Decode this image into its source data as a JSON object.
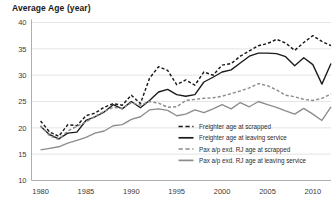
{
  "chart_data": {
    "type": "line",
    "title": "Average Age (year)",
    "xlabel": "",
    "ylabel": "Average Age (year)",
    "xlim": [
      1979,
      2012
    ],
    "ylim": [
      10,
      40
    ],
    "ytick_values": [
      40,
      35,
      30,
      25,
      20,
      15,
      10
    ],
    "ytick_labels": [
      "40",
      "35",
      "30",
      "25",
      "20",
      "15",
      "10"
    ],
    "xtick_values": [
      1980,
      1985,
      1990,
      1995,
      2000,
      2005,
      2010
    ],
    "xtick_labels": [
      "1980",
      "1985",
      "1990",
      "1995",
      "2000",
      "2005",
      "2010"
    ],
    "grid": "horizontal",
    "legend_position": "inside-lower-right",
    "x": [
      1980,
      1981,
      1982,
      1983,
      1984,
      1985,
      1986,
      1987,
      1988,
      1989,
      1990,
      1991,
      1992,
      1993,
      1994,
      1995,
      1996,
      1997,
      1998,
      1999,
      2000,
      2001,
      2002,
      2003,
      2004,
      2005,
      2006,
      2007,
      2008,
      2009,
      2010,
      2011,
      2012
    ],
    "series": [
      {
        "name": "Freighter age at scrapped",
        "style": "dashed",
        "color": "#1a1a1a",
        "values": [
          21.3,
          19.2,
          18.4,
          20.6,
          20.4,
          22.3,
          22.8,
          23.9,
          24.6,
          24.3,
          26.2,
          24.6,
          29.4,
          31.6,
          30.9,
          28.2,
          29.1,
          28.1,
          30.6,
          30.0,
          31.9,
          32.2,
          33.6,
          34.6,
          35.6,
          36.0,
          36.8,
          36.1,
          34.7,
          36.2,
          37.5,
          36.4,
          35.6
        ]
      },
      {
        "name": "Freighter age at leaving service",
        "style": "solid",
        "color": "#1a1a1a",
        "values": [
          20.3,
          18.7,
          17.9,
          19.0,
          19.2,
          21.4,
          22.1,
          23.0,
          24.4,
          23.6,
          25.0,
          23.8,
          25.2,
          26.8,
          27.3,
          26.3,
          26.0,
          26.3,
          28.7,
          29.6,
          30.6,
          31.0,
          32.3,
          33.6,
          34.2,
          34.2,
          34.1,
          33.5,
          31.8,
          33.3,
          32.0,
          28.3,
          32.2
        ]
      },
      {
        "name": "Pax a/p exd. RJ age at scrapped",
        "style": "dashed",
        "color": "#8c8c8c",
        "values": [
          20.4,
          18.5,
          17.8,
          19.4,
          20.3,
          21.1,
          22.2,
          23.1,
          23.9,
          23.7,
          24.8,
          24.3,
          25.0,
          24.7,
          23.9,
          24.0,
          25.2,
          25.4,
          25.6,
          25.7,
          26.0,
          26.5,
          27.0,
          27.6,
          28.4,
          28.0,
          27.2,
          26.2,
          25.9,
          25.4,
          25.2,
          25.6,
          26.4
        ]
      },
      {
        "name": "Pax a/p exd. RJ age at leaving service",
        "style": "solid",
        "color": "#8c8c8c",
        "values": [
          15.8,
          16.1,
          16.4,
          17.1,
          17.6,
          18.2,
          19.0,
          19.4,
          20.4,
          20.6,
          21.6,
          22.1,
          23.4,
          23.6,
          23.3,
          22.3,
          22.6,
          23.4,
          22.9,
          23.6,
          24.4,
          23.6,
          24.8,
          24.0,
          25.0,
          24.4,
          23.9,
          23.2,
          22.6,
          23.7,
          22.6,
          21.4,
          24.0
        ]
      }
    ],
    "legend": [
      {
        "label": "Freighter age at scrapped",
        "style": "dashed",
        "color": "#1a1a1a"
      },
      {
        "label": "Freighter age at leaving service",
        "style": "solid",
        "color": "#1a1a1a"
      },
      {
        "label": "Pax a/p exd. RJ age at scrapped",
        "style": "dashed",
        "color": "#8c8c8c"
      },
      {
        "label": "Pax a/p exd. RJ age at leaving service",
        "style": "solid",
        "color": "#8c8c8c"
      }
    ]
  }
}
